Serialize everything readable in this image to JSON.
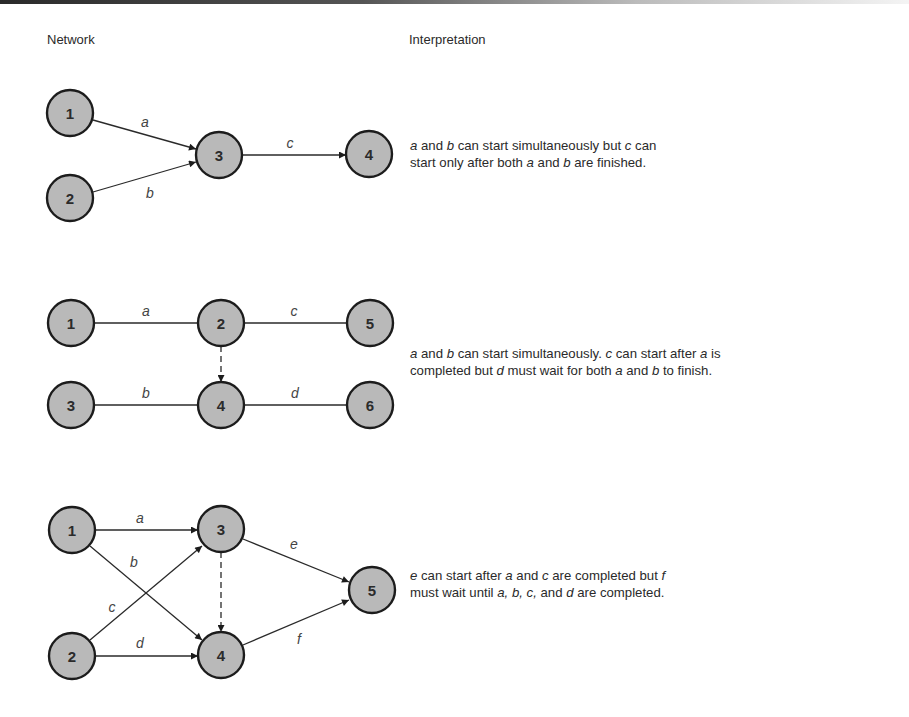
{
  "headers": {
    "network": "Network",
    "interpretation": "Interpretation"
  },
  "diagrams": [
    {
      "nodes": [
        {
          "id": "1",
          "x": 70,
          "y": 113
        },
        {
          "id": "2",
          "x": 70,
          "y": 198
        },
        {
          "id": "3",
          "x": 219,
          "y": 155
        },
        {
          "id": "4",
          "x": 369,
          "y": 154
        }
      ],
      "edges": [
        {
          "from": "1",
          "to": "3",
          "label": "a",
          "type": "arrow"
        },
        {
          "from": "2",
          "to": "3",
          "label": "b",
          "type": "arrow"
        },
        {
          "from": "3",
          "to": "4",
          "label": "c",
          "type": "arrow"
        }
      ],
      "interpretation": {
        "line1": [
          "a",
          " and ",
          "b",
          " can start simultaneously but ",
          "c",
          " can"
        ],
        "line2": [
          "start only after both ",
          "a",
          " and ",
          "b",
          " are finished."
        ]
      }
    },
    {
      "nodes": [
        {
          "id": "1",
          "x": 71,
          "y": 323
        },
        {
          "id": "2",
          "x": 221,
          "y": 323
        },
        {
          "id": "5",
          "x": 370,
          "y": 323
        },
        {
          "id": "3",
          "x": 71,
          "y": 405
        },
        {
          "id": "4",
          "x": 221,
          "y": 405
        },
        {
          "id": "6",
          "x": 370,
          "y": 405
        }
      ],
      "edges": [
        {
          "from": "1",
          "to": "2",
          "label": "a",
          "type": "line"
        },
        {
          "from": "2",
          "to": "5",
          "label": "c",
          "type": "line"
        },
        {
          "from": "3",
          "to": "4",
          "label": "b",
          "type": "line"
        },
        {
          "from": "4",
          "to": "6",
          "label": "d",
          "type": "line"
        },
        {
          "from": "2",
          "to": "4",
          "label": "",
          "type": "dummy"
        }
      ],
      "interpretation": {
        "line1": [
          "a",
          " and ",
          "b",
          " can start simultaneously. ",
          "c",
          " can start after ",
          "a",
          " is"
        ],
        "line2": [
          "completed but ",
          "d",
          " must wait for both ",
          "a",
          " and ",
          "b",
          " to finish."
        ]
      }
    },
    {
      "nodes": [
        {
          "id": "1",
          "x": 72,
          "y": 530
        },
        {
          "id": "2",
          "x": 72,
          "y": 656
        },
        {
          "id": "3",
          "x": 221,
          "y": 529
        },
        {
          "id": "4",
          "x": 221,
          "y": 655
        },
        {
          "id": "5",
          "x": 372,
          "y": 590
        }
      ],
      "edges": [
        {
          "from": "1",
          "to": "3",
          "label": "a",
          "type": "arrow"
        },
        {
          "from": "1",
          "to": "4",
          "label": "b",
          "type": "arrow"
        },
        {
          "from": "2",
          "to": "3",
          "label": "c",
          "type": "arrow"
        },
        {
          "from": "2",
          "to": "4",
          "label": "d",
          "type": "arrow"
        },
        {
          "from": "3",
          "to": "5",
          "label": "e",
          "type": "arrow"
        },
        {
          "from": "4",
          "to": "5",
          "label": "f",
          "type": "arrow"
        },
        {
          "from": "3",
          "to": "4",
          "label": "",
          "type": "dummy"
        }
      ],
      "interpretation": {
        "line1": [
          "e",
          " can start after ",
          "a",
          " and ",
          "c",
          " are completed but ",
          "f"
        ],
        "line2": [
          "must wait until ",
          "a, b, c,",
          " and ",
          "d",
          " are completed."
        ]
      }
    }
  ]
}
